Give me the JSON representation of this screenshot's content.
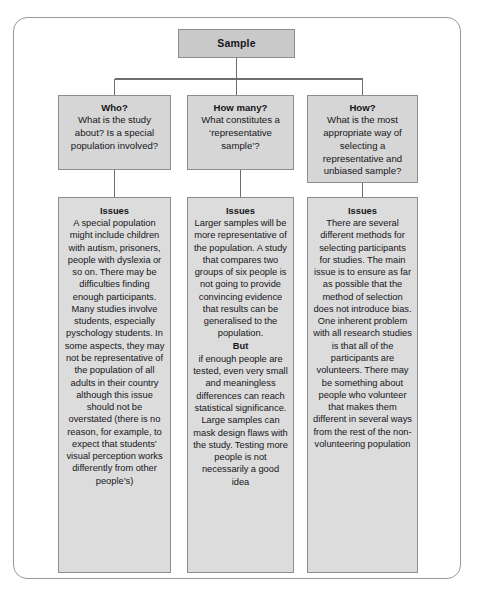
{
  "diagram": {
    "type": "tree-flowchart",
    "frame": {
      "style": "rounded-rectangle-border"
    },
    "colors": {
      "root_fill": "#c9c9c9",
      "question_fill": "#d6d6d6",
      "issues_fill": "#dcdcdc",
      "box_border": "#8d8d8d",
      "frame_border": "#9a9a9a",
      "connector": "#6e6e6e",
      "text": "#16161a",
      "page_background": "#ffffff"
    },
    "root": {
      "label": "Sample"
    },
    "columns": [
      {
        "question": {
          "heading": "Who?",
          "body": "What is the study about? Is a special population involved?"
        },
        "issues": {
          "heading": "Issues",
          "paragraphs": [
            "A special population might include children with autism, prisoners, people with dyslexia or so on. There may be difficulties finding enough participants.",
            "Many studies involve students, especially pyschology students. In some aspects, they may not be representative of the population of all adults in their country although this issue should not be overstated (there is no reason, for example, to expect that students’ visual perception works differently from other people’s)"
          ],
          "inline_headings": []
        }
      },
      {
        "question": {
          "heading": "How many?",
          "body": "What constitutes a ‘representative sample’?"
        },
        "issues": {
          "heading": "Issues",
          "paragraphs": [
            "Larger samples will be more representative of the population. A study that compares two groups of six people is not going to provide convincing evidence that results can be generalised to the population."
          ],
          "inline_headings": [
            {
              "label": "But",
              "body": "if enough people are tested, even very small and meaningless differences can reach statistical significance. Large samples can mask design flaws with the study. Testing more people is not necessarily a good idea"
            }
          ]
        }
      },
      {
        "question": {
          "heading": "How?",
          "body": "What is the most appropriate way of selecting a representative and unbiased sample?"
        },
        "issues": {
          "heading": "Issues",
          "paragraphs": [
            "There are several different methods for selecting participants for studies. The main issue is to ensure as far as possible that the method of selection does not introduce bias.",
            "One inherent problem with all research studies is that all of the participants are volunteers. There may be something about people who volunteer that makes them different in several ways from the rest of the non-volunteering population"
          ],
          "inline_headings": []
        }
      }
    ]
  }
}
